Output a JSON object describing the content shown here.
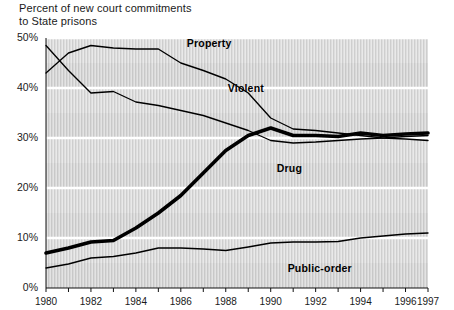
{
  "chart_data": {
    "type": "line",
    "title": "Percent of new court commitments to State prisons",
    "title_lines": [
      "Percent of new court commitments",
      "to State prisons"
    ],
    "xlabel": "",
    "ylabel": "",
    "xlim": [
      1980,
      1997
    ],
    "ylim": [
      0,
      50
    ],
    "grid": "horizontal gridlines at every 10 percent, shaded alternating horizontal bands with vertical halftone texture",
    "legend_position": "inline labels placed next to each line",
    "y_ticks": [
      "0%",
      "10%",
      "20%",
      "30%",
      "40%",
      "50%"
    ],
    "y_tick_values": [
      0,
      10,
      20,
      30,
      40,
      50
    ],
    "x_ticks": [
      "1980",
      "1982",
      "1984",
      "1986",
      "1988",
      "1990",
      "1992",
      "1994",
      "1996",
      "1997"
    ],
    "x_tick_values": [
      1980,
      1982,
      1984,
      1986,
      1988,
      1990,
      1992,
      1994,
      1996,
      1997
    ],
    "x_minor_ticks": [
      1981,
      1983,
      1985,
      1987,
      1989,
      1991,
      1993,
      1995
    ],
    "x": [
      1980,
      1981,
      1982,
      1983,
      1984,
      1985,
      1986,
      1987,
      1988,
      1989,
      1990,
      1991,
      1992,
      1993,
      1994,
      1995,
      1996,
      1997
    ],
    "series": [
      {
        "name": "Property",
        "label": "Property",
        "style": "thin-line",
        "color": "#000000",
        "values": [
          43.0,
          47.0,
          48.5,
          48.0,
          47.8,
          47.8,
          45.0,
          43.5,
          41.8,
          39.0,
          34.0,
          31.8,
          31.5,
          31.0,
          30.5,
          30.0,
          29.8,
          29.5
        ]
      },
      {
        "name": "Violent",
        "label": "Violent",
        "style": "thin-line",
        "color": "#000000",
        "values": [
          48.5,
          43.5,
          39.0,
          39.3,
          37.2,
          36.5,
          35.5,
          34.5,
          33.0,
          31.5,
          29.5,
          29.0,
          29.2,
          29.5,
          29.8,
          30.0,
          30.3,
          30.5
        ]
      },
      {
        "name": "Drug",
        "label": "Drug",
        "style": "thick-line",
        "color": "#000000",
        "values": [
          7.0,
          8.0,
          9.2,
          9.5,
          12.0,
          15.0,
          18.5,
          23.0,
          27.5,
          30.5,
          32.0,
          30.5,
          30.5,
          30.3,
          31.0,
          30.5,
          30.8,
          31.0
        ]
      },
      {
        "name": "Public-order",
        "label": "Public-order",
        "style": "thin-line",
        "color": "#000000",
        "values": [
          4.0,
          4.8,
          6.0,
          6.3,
          7.0,
          8.0,
          8.0,
          7.8,
          7.5,
          8.2,
          9.0,
          9.2,
          9.2,
          9.3,
          10.0,
          10.4,
          10.8,
          11.0
        ]
      }
    ],
    "annotations": [
      {
        "text": "Property",
        "near_series": "Property",
        "at_year": 1986,
        "at_value": 47.5
      },
      {
        "text": "Violent",
        "near_series": "Violent",
        "at_year": 1988,
        "at_value": 38.5
      },
      {
        "text": "Drug",
        "near_series": "Drug",
        "at_year": 1990,
        "at_value": 26.5
      },
      {
        "text": "Public-order",
        "near_series": "Public-order",
        "at_year": 1992,
        "at_value": 6.5
      }
    ],
    "colors": {
      "line": "#000000",
      "band_light": "#e8e8e8",
      "band_dark": "#d2d2d2",
      "background": "#ffffff",
      "text": "#1a1a1a"
    }
  }
}
